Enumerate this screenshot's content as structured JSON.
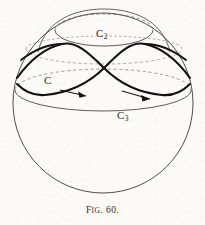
{
  "figure": {
    "caption_prefix": "F",
    "caption_smallcaps": "IG",
    "caption_number": ". 60.",
    "caption_full": "Fig. 60.",
    "background_color": "#fbfaf7",
    "ink_color": "#2b2b2b"
  },
  "labels": {
    "curve_c": {
      "text": "C",
      "subscript": ""
    },
    "curve_c2": {
      "text": "C",
      "subscript": "2"
    },
    "curve_c3": {
      "text": "C",
      "subscript": "3"
    }
  },
  "diagram": {
    "sphere": {
      "center_x": 103,
      "center_y": 103,
      "radius": 90,
      "stroke": "#3a3a3a",
      "stroke_width": 0.9
    },
    "ellipse_c2": {
      "center_x": 104,
      "center_y": 30,
      "rx": 49,
      "ry": 16,
      "stroke": "#4a4a4a",
      "front_solid": true,
      "back_dashed": true
    },
    "ellipse_c3": {
      "center_x": 103,
      "center_y": 90,
      "rx": 88,
      "ry": 21,
      "stroke": "#4a4a4a",
      "front_solid": true,
      "back_dashed": true
    },
    "ellipse_mid_dashed": {
      "center_x": 103,
      "center_y": 50,
      "rx": 79,
      "ry": 14,
      "stroke": "#6a6a6a",
      "dashed": true
    },
    "curve_c": {
      "description": "bold figure-eight crossing curve on sphere",
      "crossing_x": 104,
      "crossing_y": 68,
      "stroke": "#111111",
      "stroke_width": 2.1,
      "arrow_count": 2,
      "arrows": [
        {
          "x": 76,
          "y": 96,
          "direction": "right"
        },
        {
          "x": 141,
          "y": 98,
          "direction": "right"
        }
      ]
    }
  }
}
